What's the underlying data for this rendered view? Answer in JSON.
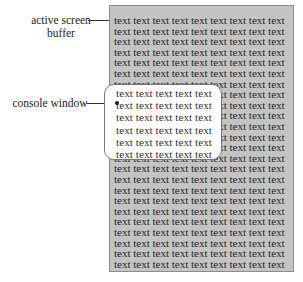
{
  "labels": {
    "active_screen_buffer_line1": "active screen",
    "active_screen_buffer_line2": "buffer",
    "console_window": "console window"
  },
  "buffer": {
    "rows": 24,
    "line_text": "text text text text text text text text text"
  },
  "console": {
    "rows": 6,
    "line_text": "text text text text text"
  },
  "colors": {
    "buffer_bg": "#c4c4c4",
    "console_bg": "#ffffff",
    "text": "#2a2a2a"
  }
}
